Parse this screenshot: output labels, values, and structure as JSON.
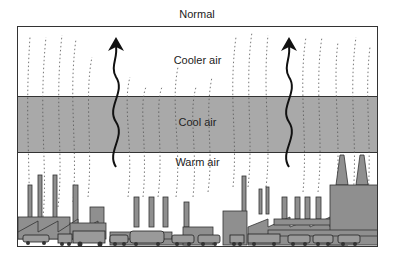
{
  "title": "Normal",
  "layers": [
    {
      "label": "Cooler air",
      "fill": "#ffffff"
    },
    {
      "label": "Cool air",
      "fill": "#a9a9a9"
    },
    {
      "label": "Warm air",
      "fill": "#ffffff"
    }
  ],
  "elements": {
    "arrows": [
      "rising-air-arrow-left",
      "rising-air-arrow-right"
    ],
    "scene": "factories-smokestacks-vehicles"
  },
  "colors": {
    "band": "#a9a9a9",
    "buildings": "#8f8f8f",
    "outline": "#333333"
  }
}
